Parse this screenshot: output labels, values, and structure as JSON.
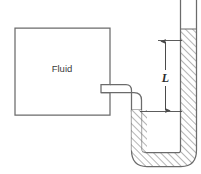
{
  "figure": {
    "name": "manometer-tube-diagram",
    "type": "technical-line-diagram",
    "background_color": "#ffffff",
    "width": 201,
    "height": 174
  },
  "tank": {
    "label": "Fluid",
    "outline_color": "#6b6b6b",
    "fill_color": "#ffffff",
    "label_color": "#3a3a3a"
  },
  "pipe": {
    "name": "s-bend-connector",
    "outline_color": "#6b6b6b",
    "fill_color": "#ffffff"
  },
  "utube": {
    "name": "u-tube-manometer",
    "outline_color": "#6b6b6b",
    "hatch_color": "#5a5a5a",
    "hatch_fill_color": "#ffffff"
  },
  "dimension": {
    "label": "L",
    "label_color": "#2b2b2b",
    "arrow_color": "#4a4a4a",
    "style": "double-headed-vertical-arrow"
  },
  "colors": {
    "line": "#6b6b6b",
    "hatch": "#5a5a5a",
    "text": "#3a3a3a",
    "arrow": "#4a4a4a"
  }
}
